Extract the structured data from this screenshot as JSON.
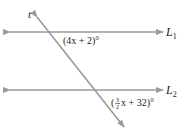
{
  "diagram": {
    "type": "parallel-lines-transversal",
    "lines": [
      {
        "id": "L1",
        "label": "L",
        "subscript": "1"
      },
      {
        "id": "L2",
        "label": "L",
        "subscript": "2"
      }
    ],
    "transversal": {
      "label": "t"
    },
    "angles": [
      {
        "id": "angle-1",
        "expression": "(4x + 2)°"
      },
      {
        "id": "angle-2",
        "prefix": "(",
        "frac_num": "3",
        "frac_den": "2",
        "suffix": "x + 32)°"
      }
    ],
    "colors": {
      "line": "#9a9a9a",
      "text": "#222222",
      "background": "#ffffff"
    }
  }
}
